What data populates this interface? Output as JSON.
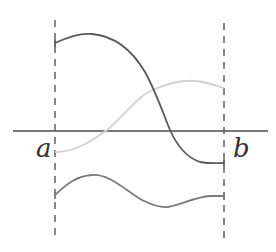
{
  "diagram": {
    "labels": {
      "left": "a",
      "right": "b"
    },
    "colors": {
      "axis": "#4a4a4a",
      "dashed": "#555555",
      "curve_dark": "#5a5a5a",
      "curve_light": "#d0d0d0",
      "curve_bottom": "#7a7a7a"
    },
    "curves": [
      {
        "name": "dark-decreasing-curve",
        "description": "starts high at a, decreases, crosses axis, ends below axis at b"
      },
      {
        "name": "light-increasing-curve",
        "description": "starts below axis at a, increases, ends above axis at b"
      },
      {
        "name": "bottom-wave-curve",
        "description": "wave below axis between a and b"
      }
    ]
  }
}
